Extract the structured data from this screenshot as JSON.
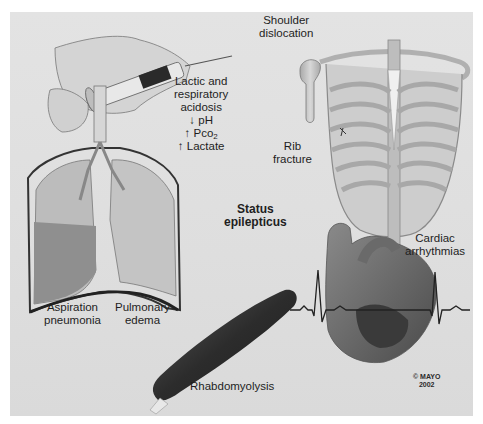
{
  "figure": {
    "center_label": [
      "Status",
      "epilepticus"
    ],
    "complications": [
      {
        "id": "acidosis",
        "lines": [
          "Lactic and",
          "respiratory",
          "acidosis"
        ],
        "indicators": [
          {
            "arrow": "↓",
            "text": "pH"
          },
          {
            "arrow": "↑",
            "text": "Pco",
            "sub": "2"
          },
          {
            "arrow": "↑",
            "text": "Lactate"
          }
        ]
      },
      {
        "id": "shoulder",
        "lines": [
          "Shoulder",
          "dislocation"
        ]
      },
      {
        "id": "rib",
        "lines": [
          "Rib",
          "fracture"
        ]
      },
      {
        "id": "aspiration",
        "lines": [
          "Aspiration",
          "pneumonia"
        ]
      },
      {
        "id": "edema",
        "lines": [
          "Pulmonary",
          "edema"
        ]
      },
      {
        "id": "cardiac",
        "lines": [
          "Cardiac",
          "arrhythmias"
        ]
      },
      {
        "id": "rhabdo",
        "lines": [
          "Rhabdomyolysis"
        ]
      }
    ],
    "copyright": [
      "© MAYO",
      "2002"
    ]
  },
  "colors": {
    "background": "#dedede",
    "text": "#1e1e1e",
    "bone": "#c9c9c9",
    "muscle": "#3a3a3a",
    "lung_light": "#b8b8b8",
    "fluid": "#8c8c8c"
  }
}
